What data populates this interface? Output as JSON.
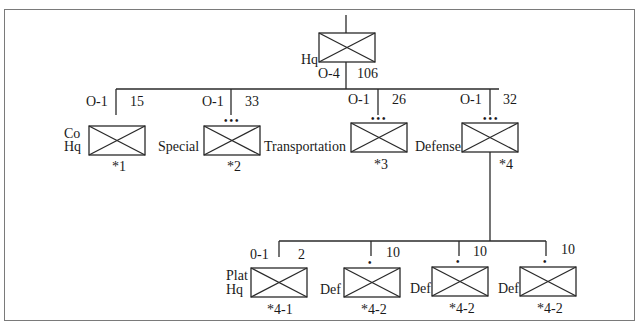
{
  "diagram": {
    "type": "military-org-chart",
    "root": {
      "label": "Hq",
      "officers": "O-4",
      "enlisted": "106"
    },
    "units": [
      {
        "id": "co-hq",
        "label_line1": "Co",
        "label_line2": "Hq",
        "officers": "O-1",
        "enlisted": "15",
        "note": "*1",
        "size_marker": ""
      },
      {
        "id": "special-transportation",
        "label_left": "Special",
        "label_right": "Transportation",
        "officers": "O-1",
        "enlisted": "33",
        "note": "*2",
        "size_marker": "•••"
      },
      {
        "id": "unit-3",
        "officers": "O-1",
        "enlisted": "26",
        "note": "*3",
        "size_marker": "•••"
      },
      {
        "id": "defense",
        "label_left": "Defense",
        "officers": "O-1",
        "enlisted": "32",
        "note": "*4",
        "size_marker": "•••"
      }
    ],
    "subunits": [
      {
        "id": "plat-hq",
        "label_line1": "Plat",
        "label_line2": "Hq",
        "officers": "0-1",
        "enlisted": "2",
        "note": "*4-1",
        "size_marker": ""
      },
      {
        "id": "def-1",
        "label": "Def",
        "enlisted": "10",
        "note": "*4-2",
        "size_marker": "•"
      },
      {
        "id": "def-2",
        "label": "Def",
        "enlisted": "10",
        "note": "*4-2",
        "size_marker": "•"
      },
      {
        "id": "def-3",
        "label": "Def",
        "enlisted": "10",
        "note": "*4-2",
        "size_marker": "•"
      }
    ]
  }
}
